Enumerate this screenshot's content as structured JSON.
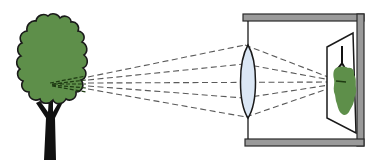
{
  "diagram": {
    "type": "camera-lens-image-formation",
    "elements": [
      {
        "id": "tree",
        "label": "object tree",
        "color": "#5e8f4a"
      },
      {
        "id": "lens",
        "label": "convex lens",
        "color": "#dbe7f5"
      },
      {
        "id": "camera-box",
        "label": "camera body",
        "color": "#9a9a9a"
      },
      {
        "id": "screen",
        "label": "image screen"
      },
      {
        "id": "image",
        "label": "inverted real image",
        "color": "#5e8f4a"
      }
    ],
    "rays": 5,
    "colors": {
      "foliage": "#5e8f4a",
      "trunk": "#111111",
      "lens_fill": "#dbe7f5",
      "frame": "#9a9a9a",
      "ray": "#5a5a5a"
    }
  }
}
